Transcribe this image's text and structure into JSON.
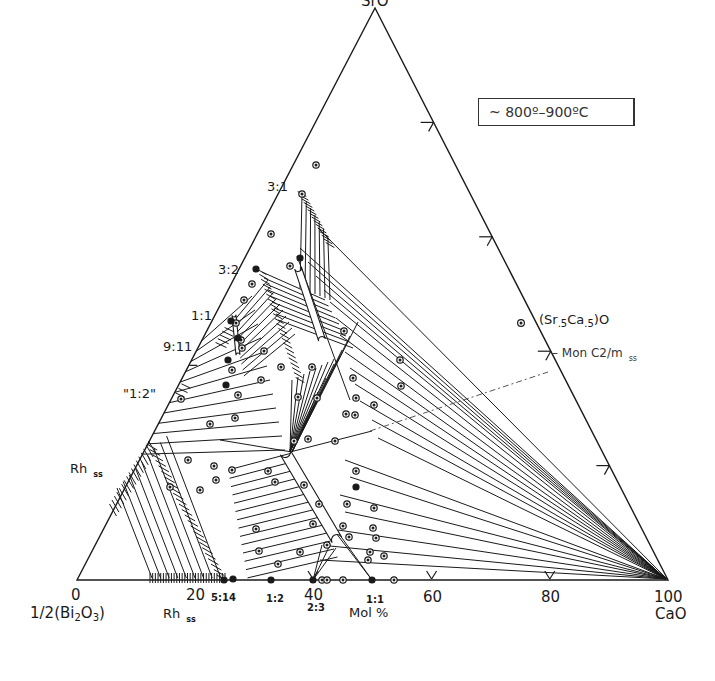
{
  "temperature_label": "~ 800º–900ºC",
  "apexes": {
    "top": "SrO",
    "left_value": "0",
    "left_name_prefix": "1/2(Bi",
    "left_sub1": "2",
    "left_mid": "O",
    "left_sub2": "3",
    "left_suffix": ")",
    "right_value": "100",
    "right_name": "CaO"
  },
  "axis": {
    "unit_label": "Mol %",
    "ticks": [
      "20",
      "40",
      "60",
      "80"
    ]
  },
  "left_edge_labels": {
    "r31": "3:1",
    "r32": "3:2",
    "r11": "1:1",
    "r911": "9:11",
    "r12q": "\"1:2\"",
    "rh_main": "Rh",
    "rh_sub": "ss"
  },
  "base_labels": {
    "r514": "5:14",
    "r12": "1:2",
    "r23": "2:3",
    "r11": "1:1",
    "rh_main": "Rh",
    "rh_sub": "ss"
  },
  "right_edge_labels": {
    "srca_prefix": "(Sr",
    "srca_sub1": ".5",
    "srca_mid": "Ca",
    "srca_sub2": ".5",
    "srca_suffix": ")O",
    "mon": "Mon  C2/m",
    "mon_sub": "ss"
  },
  "colors": {
    "ink": "#1a1a1a",
    "paper": "#ffffff",
    "dashed": "#555555"
  },
  "geometry": {
    "apex_top": [
      375,
      8
    ],
    "corner_left": [
      77,
      580
    ],
    "corner_right": [
      668,
      580
    ]
  }
}
